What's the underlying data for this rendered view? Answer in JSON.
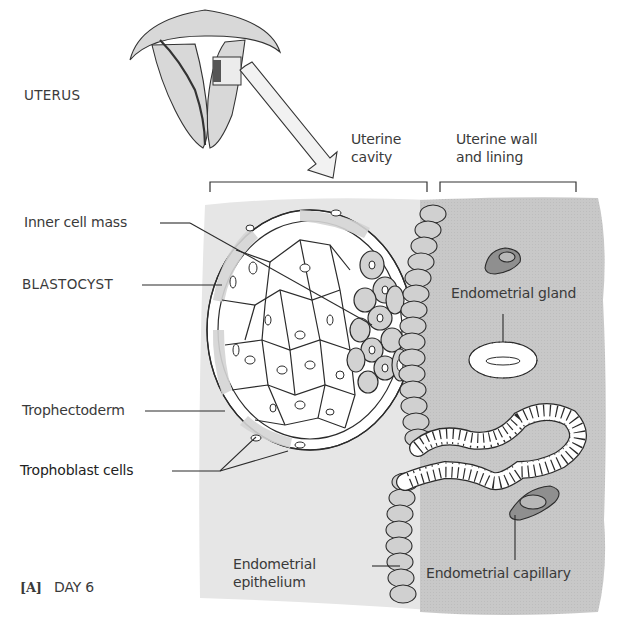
{
  "figure": {
    "panel_label": "[A]",
    "day_label": "DAY 6",
    "uterus_label": "UTERUS"
  },
  "regions": {
    "uterine_cavity": "Uterine\ncavity",
    "uterine_wall": "Uterine wall\nand lining"
  },
  "labels": {
    "inner_cell_mass": "Inner cell mass",
    "blastocyst": "BLASTOCYST",
    "trophectoderm": "Trophectoderm",
    "trophoblast_cells": "Trophoblast cells",
    "endometrial_gland": "Endometrial gland",
    "endometrial_epithelium": "Endometrial\nepithelium",
    "endometrial_capillary": "Endometrial capillary"
  },
  "colors": {
    "cavity_bg": "#e8e8e8",
    "wall_bg": "#c9c9c9",
    "cell_fill": "#d6d6d6",
    "capillary_fill": "#8f8f8f",
    "line": "#2b2b2b"
  }
}
